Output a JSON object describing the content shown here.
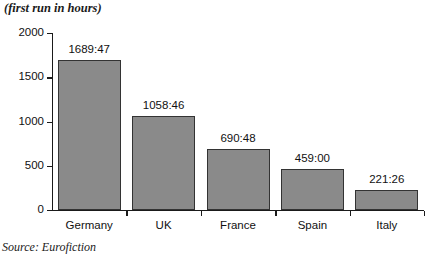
{
  "title_caption": "(first run in hours)",
  "source_caption": "Source: Eurofiction",
  "chart_data": {
    "type": "bar",
    "title": "(first run in hours)",
    "xlabel": "",
    "ylabel": "Hours",
    "ylim": [
      0,
      2000
    ],
    "yticks": [
      0,
      500,
      1000,
      1500,
      2000
    ],
    "ytick_labels": [
      "0",
      "500",
      "1000",
      "1500",
      "2000"
    ],
    "grid": false,
    "legend": false,
    "source": "Source: Eurofiction",
    "bar_color": "#8a8a8a",
    "bar_edge_color": "#333333",
    "categories": [
      "Germany",
      "UK",
      "France",
      "Spain",
      "Italy"
    ],
    "values": [
      1689.78,
      1058.77,
      690.8,
      459.0,
      221.43
    ],
    "value_labels": [
      "1689:47",
      "1058:46",
      "690:48",
      "459:00",
      "221:26"
    ]
  }
}
